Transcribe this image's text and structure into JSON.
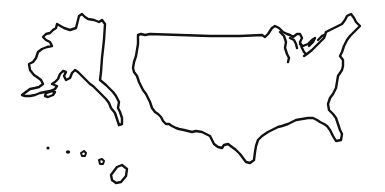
{
  "image": {
    "description": "Black line-drawing outline map of the United States on a white background",
    "regions": [
      {
        "name": "Alaska"
      },
      {
        "name": "Contiguous United States"
      },
      {
        "name": "Hawaii"
      }
    ],
    "colors": {
      "background": "#ffffff",
      "stroke": "#111111"
    }
  }
}
